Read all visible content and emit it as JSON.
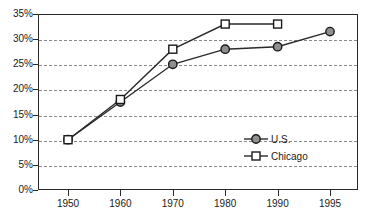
{
  "chart_data": {
    "type": "line",
    "title": "",
    "subtitle": "",
    "xlabel": "",
    "ylabel": "",
    "categories": [
      "1950",
      "1960",
      "1970",
      "1980",
      "1990",
      "1995"
    ],
    "ylim": [
      0,
      35
    ],
    "ytick_labels": [
      "0%",
      "5%",
      "10%",
      "15%",
      "20%",
      "25%",
      "30%",
      "35%"
    ],
    "ytick_values": [
      0,
      5,
      10,
      15,
      20,
      25,
      30,
      35
    ],
    "grid": "horizontal-dashed",
    "legend_position": "inside-lower-right",
    "series": [
      {
        "name": "U.S.",
        "marker": "filled-circle",
        "color": "#8f8f8f",
        "values": [
          10,
          17.5,
          25,
          28,
          28.5,
          31.5
        ]
      },
      {
        "name": "Chicago",
        "marker": "hollow-square",
        "color": "#ffffff",
        "values": [
          10,
          18,
          28,
          33,
          33,
          null
        ]
      }
    ],
    "legend": [
      {
        "label": "U.S.",
        "marker": "filled-circle"
      },
      {
        "label": "Chicago",
        "marker": "hollow-square"
      }
    ]
  }
}
